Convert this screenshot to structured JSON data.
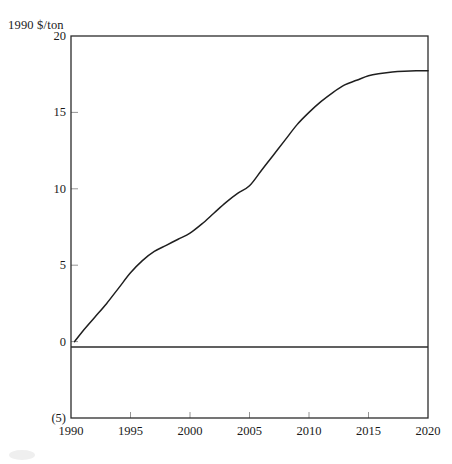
{
  "chart_data": {
    "type": "line",
    "title": "",
    "subtitle": "",
    "xlabel": "",
    "ylabel": "1990 $/ton",
    "unit_label": "1990 $/ton",
    "x": [
      1990,
      1995,
      2000,
      2005,
      2010,
      2015,
      2020
    ],
    "xlim": [
      1990,
      2020
    ],
    "ylim": [
      -5,
      20
    ],
    "grid": false,
    "legend": "none",
    "xticks": [
      "1990",
      "1995",
      "2000",
      "2005",
      "2010",
      "2015",
      "2020"
    ],
    "xtick_values": [
      1990,
      1995,
      2000,
      2005,
      2010,
      2015,
      2020
    ],
    "yticks": [
      "20",
      "15",
      "10",
      "5",
      "0",
      "(5)"
    ],
    "ytick_values": [
      20,
      15,
      10,
      5,
      0,
      -5
    ],
    "series": [
      {
        "name": "carbon price",
        "values": [
          0,
          4.5,
          7.1,
          10.2,
          15.0,
          17.4,
          17.7
        ],
        "points": [
          [
            1990.3,
            0.0
          ],
          [
            1991,
            0.7
          ],
          [
            1992,
            1.6
          ],
          [
            1993,
            2.5
          ],
          [
            1994,
            3.5
          ],
          [
            1995,
            4.5
          ],
          [
            1996,
            5.3
          ],
          [
            1997,
            5.9
          ],
          [
            1998,
            6.3
          ],
          [
            1999,
            6.7
          ],
          [
            2000,
            7.1
          ],
          [
            2001,
            7.7
          ],
          [
            2002,
            8.4
          ],
          [
            2003,
            9.1
          ],
          [
            2004,
            9.7
          ],
          [
            2005,
            10.2
          ],
          [
            2006,
            11.2
          ],
          [
            2007,
            12.2
          ],
          [
            2008,
            13.2
          ],
          [
            2009,
            14.2
          ],
          [
            2010,
            15.0
          ],
          [
            2011,
            15.7
          ],
          [
            2012,
            16.3
          ],
          [
            2013,
            16.8
          ],
          [
            2014,
            17.1
          ],
          [
            2015,
            17.4
          ],
          [
            2016,
            17.55
          ],
          [
            2017,
            17.65
          ],
          [
            2018,
            17.7
          ],
          [
            2019,
            17.72
          ],
          [
            2020,
            17.72
          ]
        ],
        "color": "#1f1f1f"
      }
    ],
    "zero_line": 0,
    "annotations": []
  }
}
